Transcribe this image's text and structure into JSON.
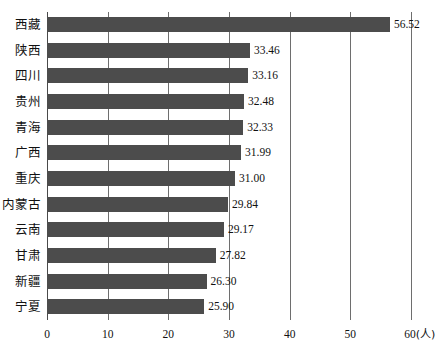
{
  "chart_data": {
    "type": "bar",
    "orientation": "horizontal",
    "title": "",
    "subtitle": "",
    "xlabel": "60(人)",
    "ylabel": "",
    "xlim": [
      0,
      60
    ],
    "xticks": [
      "0",
      "10",
      "20",
      "30",
      "40",
      "50",
      "60"
    ],
    "xtick_last_suffix": "(人)",
    "unit_note": "(人)",
    "grid": "vertical",
    "legend": "none",
    "categories": [
      "西藏",
      "陕西",
      "四川",
      "贵州",
      "青海",
      "广西",
      "重庆",
      "内蒙古",
      "云南",
      "甘肃",
      "新疆",
      "宁夏"
    ],
    "values": [
      56.52,
      33.46,
      33.16,
      32.48,
      32.33,
      31.99,
      31.0,
      29.84,
      29.17,
      27.82,
      26.3,
      25.9
    ],
    "value_labels": [
      "56.52",
      "33.46",
      "33.16",
      "32.48",
      "32.33",
      "31.99",
      "31.00",
      "29.84",
      "29.17",
      "27.82",
      "26.30",
      "25.90"
    ],
    "bar_color": "#4c4c4c",
    "gridline_color": "#6e6e6e",
    "axis_color": "#4a4a4a",
    "background_color": "#ffffff"
  }
}
